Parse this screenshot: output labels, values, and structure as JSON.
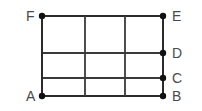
{
  "figure": {
    "background_color": "#ffffff",
    "line_color": "#2b2b2b",
    "dot_color": "#111111",
    "label_color": "#4a4a4a",
    "width": 202,
    "height": 111,
    "geometry": {
      "left": 42,
      "right": 163,
      "top": 16,
      "bottom": 96,
      "interior_verticals_x": [
        85,
        125
      ],
      "horizontals_y": [
        16,
        53,
        78,
        96
      ],
      "columns": 3,
      "rows": 3,
      "dot_radius": 3.2
    },
    "vertices": [
      {
        "id": "vertex-f",
        "label": "F",
        "x": 42,
        "y": 16,
        "label_x": 26,
        "label_y": 9,
        "dot": true
      },
      {
        "id": "vertex-e",
        "label": "E",
        "x": 163,
        "y": 16,
        "label_x": 172,
        "label_y": 9,
        "dot": true
      },
      {
        "id": "vertex-d",
        "label": "D",
        "x": 163,
        "y": 53,
        "label_x": 172,
        "label_y": 46,
        "dot": true
      },
      {
        "id": "vertex-c",
        "label": "C",
        "x": 163,
        "y": 78,
        "label_x": 172,
        "label_y": 71,
        "dot": true
      },
      {
        "id": "vertex-a",
        "label": "A",
        "x": 42,
        "y": 96,
        "label_x": 26,
        "label_y": 89,
        "dot": true
      },
      {
        "id": "vertex-b",
        "label": "B",
        "x": 163,
        "y": 96,
        "label_x": 172,
        "label_y": 89,
        "dot": true
      }
    ],
    "segments": [
      {
        "id": "edge-top-fe",
        "kind": "horizontal",
        "x1": 42,
        "y1": 16,
        "x2": 163,
        "y2": 16,
        "interior": false
      },
      {
        "id": "edge-mid-d",
        "kind": "horizontal",
        "x1": 42,
        "y1": 53,
        "x2": 163,
        "y2": 53,
        "interior": true
      },
      {
        "id": "edge-mid-c",
        "kind": "horizontal",
        "x1": 42,
        "y1": 78,
        "x2": 163,
        "y2": 78,
        "interior": true
      },
      {
        "id": "edge-bottom-ab",
        "kind": "horizontal",
        "x1": 42,
        "y1": 96,
        "x2": 163,
        "y2": 96,
        "interior": false
      },
      {
        "id": "edge-left-fa",
        "kind": "vertical",
        "x1": 42,
        "y1": 16,
        "x2": 42,
        "y2": 96,
        "interior": false
      },
      {
        "id": "edge-interior-v1",
        "kind": "vertical",
        "x1": 85,
        "y1": 16,
        "x2": 85,
        "y2": 96,
        "interior": true
      },
      {
        "id": "edge-interior-v2",
        "kind": "vertical",
        "x1": 125,
        "y1": 16,
        "x2": 125,
        "y2": 96,
        "interior": true
      },
      {
        "id": "edge-right-eb",
        "kind": "vertical",
        "x1": 163,
        "y1": 16,
        "x2": 163,
        "y2": 96,
        "interior": false
      }
    ]
  }
}
